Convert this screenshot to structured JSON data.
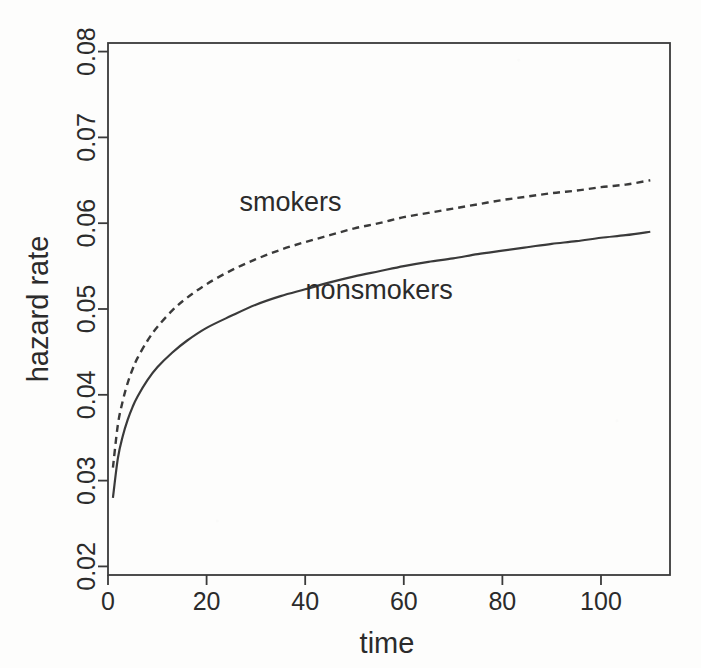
{
  "chart_data": {
    "type": "line",
    "title": "",
    "xlabel": "time",
    "ylabel": "hazard rate",
    "xlim": [
      0,
      114
    ],
    "ylim": [
      0.019,
      0.081
    ],
    "xticks": [
      0,
      20,
      40,
      60,
      80,
      100
    ],
    "xticklabels": [
      "0",
      "20",
      "40",
      "60",
      "80",
      "100"
    ],
    "yticks": [
      0.02,
      0.03,
      0.04,
      0.05,
      0.06,
      0.07,
      0.08
    ],
    "yticklabels": [
      "0.02",
      "0.03",
      "0.04",
      "0.05",
      "0.06",
      "0.07",
      "0.08"
    ],
    "grid": false,
    "legend": "inline-annotations",
    "frame": "box",
    "line_color": "#3a3a3a",
    "series": [
      {
        "name": "smokers",
        "style": "dashed",
        "annotation": "smokers",
        "annotation_at": {
          "x": 37,
          "y": 0.0625
        },
        "x": [
          1,
          2,
          3,
          4,
          5,
          6,
          8,
          10,
          13,
          16,
          20,
          25,
          30,
          35,
          40,
          45,
          50,
          55,
          60,
          65,
          70,
          75,
          80,
          85,
          90,
          95,
          100,
          105,
          110
        ],
        "values": [
          0.0315,
          0.0365,
          0.0393,
          0.0414,
          0.043,
          0.0443,
          0.0463,
          0.0479,
          0.0498,
          0.0513,
          0.0529,
          0.0545,
          0.0558,
          0.0569,
          0.0578,
          0.0586,
          0.0594,
          0.06,
          0.0607,
          0.0612,
          0.0617,
          0.0622,
          0.0627,
          0.0631,
          0.0635,
          0.0638,
          0.0642,
          0.0645,
          0.065
        ]
      },
      {
        "name": "nonsmokers",
        "style": "solid",
        "annotation": "nonsmokers",
        "annotation_at": {
          "x": 55,
          "y": 0.0522
        },
        "x": [
          1,
          2,
          3,
          4,
          5,
          6,
          8,
          10,
          13,
          16,
          20,
          25,
          30,
          35,
          40,
          45,
          50,
          55,
          60,
          65,
          70,
          75,
          80,
          85,
          90,
          95,
          100,
          105,
          110
        ],
        "values": [
          0.028,
          0.0326,
          0.0352,
          0.0371,
          0.0386,
          0.0398,
          0.0417,
          0.0432,
          0.0449,
          0.0463,
          0.0478,
          0.0492,
          0.0505,
          0.0515,
          0.0523,
          0.0531,
          0.0538,
          0.0544,
          0.055,
          0.0555,
          0.0559,
          0.0564,
          0.0568,
          0.0572,
          0.0576,
          0.0579,
          0.0583,
          0.0586,
          0.059
        ]
      }
    ]
  }
}
